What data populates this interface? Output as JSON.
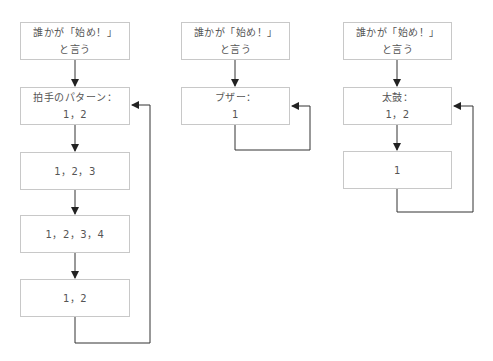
{
  "diagrams": [
    {
      "name": "clap",
      "boxes": [
        {
          "line1": "誰かが「始め！」",
          "line2": "と言う"
        },
        {
          "line1": "拍手のパターン：",
          "line2": "1，2"
        },
        {
          "line1": "1，2，3",
          "line2": ""
        },
        {
          "line1": "1，2，3，4",
          "line2": ""
        },
        {
          "line1": "1，2",
          "line2": ""
        }
      ]
    },
    {
      "name": "buzzer",
      "boxes": [
        {
          "line1": "誰かが「始め！」",
          "line2": "と言う"
        },
        {
          "line1": "ブザー：",
          "line2": "1"
        }
      ]
    },
    {
      "name": "drum",
      "boxes": [
        {
          "line1": "誰かが「始め！」",
          "line2": "と言う"
        },
        {
          "line1": "太鼓：",
          "line2": "1，2"
        },
        {
          "line1": "1",
          "line2": ""
        }
      ]
    }
  ],
  "colors": {
    "box_border": "#c8c8c8",
    "text": "#555555",
    "arrow": "#222222"
  }
}
